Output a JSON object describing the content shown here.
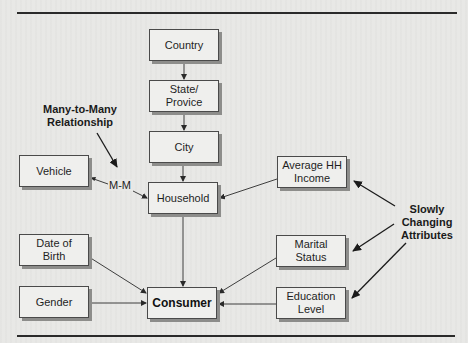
{
  "diagram": {
    "type": "hierarchy-diagram",
    "nodes": {
      "country": {
        "label": "Country"
      },
      "state": {
        "label": "State/\nProvice"
      },
      "city": {
        "label": "City"
      },
      "household": {
        "label": "Household"
      },
      "consumer": {
        "label": "Consumer"
      },
      "vehicle": {
        "label": "Vehicle"
      },
      "date_of_birth": {
        "label": "Date of\nBirth"
      },
      "gender": {
        "label": "Gender"
      },
      "avg_hh_income": {
        "label": "Average HH\nIncome"
      },
      "marital_status": {
        "label": "Marital\nStatus"
      },
      "education_level": {
        "label": "Education\nLevel"
      }
    },
    "edge_labels": {
      "vehicle_household": "M-M"
    },
    "annotations": {
      "many_to_many": "Many-to-Many\nRelationship",
      "slowly_changing": "Slowly\nChanging\nAttributes"
    },
    "edges": [
      {
        "from": "Country",
        "to": "State/Provice"
      },
      {
        "from": "State/Provice",
        "to": "City"
      },
      {
        "from": "City",
        "to": "Household"
      },
      {
        "from": "Vehicle",
        "to": "Household",
        "label": "M-M",
        "bidirectional": true
      },
      {
        "from": "Average HH Income",
        "to": "Household"
      },
      {
        "from": "Household",
        "to": "Consumer"
      },
      {
        "from": "Date of Birth",
        "to": "Consumer"
      },
      {
        "from": "Gender",
        "to": "Consumer"
      },
      {
        "from": "Marital Status",
        "to": "Consumer"
      },
      {
        "from": "Education Level",
        "to": "Consumer"
      }
    ],
    "colors": {
      "background": "#e8e8e6",
      "box_fill": "#efefed",
      "box_border": "#4a4a4a",
      "shadow": "#8d8d8b",
      "line": "#2a2a2a"
    }
  }
}
